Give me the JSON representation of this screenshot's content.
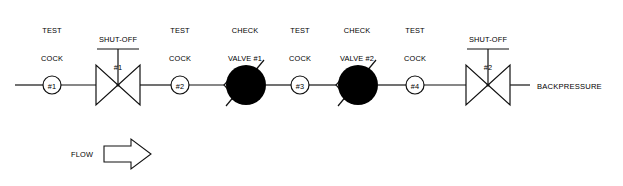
{
  "diagram": {
    "pipeline": {
      "centerline_y": 85,
      "start_x": 15,
      "end_x": 530,
      "color": "#111111",
      "stroke_width": 1.2
    },
    "flow_note": {
      "text": "FLOW",
      "arrow_direction": "right"
    },
    "outlet_label": "BACKPRESSURE",
    "components": [
      {
        "id": "test-cock-1",
        "type": "test-cock",
        "cx": 52,
        "label_lines": [
          "TEST",
          "COCK",
          "#1"
        ],
        "label_x": 52,
        "label_y": 8
      },
      {
        "id": "shut-off-1",
        "type": "shut-off-valve",
        "cx": 118,
        "label_lines": [
          "SHUT-OFF",
          "#1"
        ],
        "label_x": 118,
        "label_y": 17
      },
      {
        "id": "test-cock-2",
        "type": "test-cock",
        "cx": 180,
        "label_lines": [
          "TEST",
          "COCK",
          "#2"
        ],
        "label_x": 180,
        "label_y": 8
      },
      {
        "id": "check-valve-1",
        "type": "check-valve-closed",
        "cx": 245,
        "label_lines": [
          "CHECK",
          "VALVE #1",
          "(CLOSED)"
        ],
        "label_x": 245,
        "label_y": 8
      },
      {
        "id": "test-cock-3",
        "type": "test-cock",
        "cx": 300,
        "label_lines": [
          "TEST",
          "COCK",
          "#3"
        ],
        "label_x": 300,
        "label_y": 8
      },
      {
        "id": "check-valve-2",
        "type": "check-valve-closed",
        "cx": 357,
        "label_lines": [
          "CHECK",
          "VALVE #2",
          "(CLOSED)"
        ],
        "label_x": 357,
        "label_y": 8
      },
      {
        "id": "test-cock-4",
        "type": "test-cock",
        "cx": 415,
        "label_lines": [
          "TEST",
          "COCK",
          "#4"
        ],
        "label_x": 415,
        "label_y": 8
      },
      {
        "id": "shut-off-2",
        "type": "shut-off-valve",
        "cx": 488,
        "label_lines": [
          "SHUT-OFF",
          "#2"
        ],
        "label_x": 488,
        "label_y": 17
      }
    ],
    "colors": {
      "line": "#111111",
      "valve_fill": "#000000",
      "test_cock_fill": "#ffffff",
      "text": "#000000",
      "background": "#ffffff"
    }
  }
}
